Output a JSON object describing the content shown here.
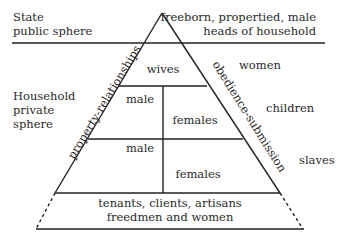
{
  "diagram": {
    "type": "pyramid",
    "colors": {
      "line": "#222222",
      "text": "#2a2a2a",
      "background": "#ffffff"
    },
    "left_labels": {
      "state_line1": "State",
      "state_line2": "public sphere",
      "household_line1": "Household",
      "household_line2": "private",
      "household_line3": "sphere"
    },
    "right_labels": {
      "top_line1": "freeborn, propertied, male",
      "top_line2": "heads of household",
      "women": "women",
      "children": "children",
      "slaves": "slaves"
    },
    "side_labels": {
      "left": "property-relationships",
      "right": "obedience-submission"
    },
    "cells": {
      "wives": "wives",
      "male_upper": "male",
      "females_upper": "females",
      "male_lower": "male",
      "females_lower": "females",
      "base_line1": "tenants, clients, artisans",
      "base_line2": "freedmen and women"
    }
  }
}
